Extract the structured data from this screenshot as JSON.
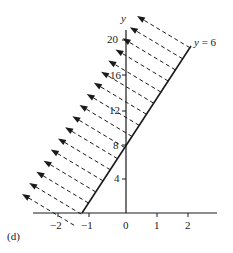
{
  "chart_data": {
    "type": "line",
    "title": "",
    "panel_label": "(d)",
    "xlabel": "",
    "ylabel": "y",
    "x_ticks": [
      -2,
      -1,
      0,
      1,
      2
    ],
    "x_tick_labels": [
      "−2",
      "−1",
      "0",
      "1",
      "2"
    ],
    "y_ticks": [
      4,
      8,
      12,
      16,
      20
    ],
    "y_tick_labels": [
      "4",
      "8",
      "12",
      "16",
      "20"
    ],
    "xlim": [
      -3.0,
      2.8
    ],
    "ylim": [
      0,
      22
    ],
    "grid": false,
    "series": [
      {
        "name": "boundary line",
        "label": "y = 6",
        "style": "solid",
        "points": [
          [
            -1.33,
            0
          ],
          [
            0,
            8
          ],
          [
            2.1,
            20.6
          ]
        ]
      }
    ],
    "shading": {
      "description": "dashed arrows pointing up-left from the line, indicating the region above the line",
      "arrow_count": 17,
      "style": "dashed-arrows"
    }
  },
  "labels": {
    "y_axis": "y",
    "line_label_y": "y",
    "line_label_rest": " = 6",
    "panel": "(d)",
    "xticks": [
      "−2",
      "−1",
      "0",
      "1",
      "2"
    ],
    "yticks": [
      "20",
      "16",
      "12",
      "8",
      "4"
    ]
  },
  "colors": {
    "ink": "#1a1a1a",
    "background": "#ffffff"
  }
}
